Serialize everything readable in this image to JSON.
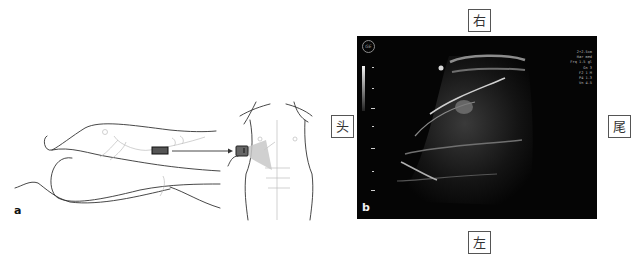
{
  "figure": {
    "panel_a": {
      "letter": "a",
      "description": "Line drawing of patient lying on side with probe position and frontal torso view with probe and scan fan over right upper abdomen"
    },
    "panel_b": {
      "letter": "b",
      "logo": "GE",
      "info_lines": [
        "2+2.5cm",
        "Har med",
        "Frq 1.5 gl",
        "Gn 3",
        "F2 1 M",
        "P4 1.3",
        "Vn 4.5"
      ],
      "image_type": "ultrasound-scan",
      "colors": {
        "background": "#050505",
        "echo": "#d9d9d9"
      }
    },
    "orientation_labels": {
      "top": "右",
      "bottom": "左",
      "left": "头",
      "right": "尾"
    }
  }
}
